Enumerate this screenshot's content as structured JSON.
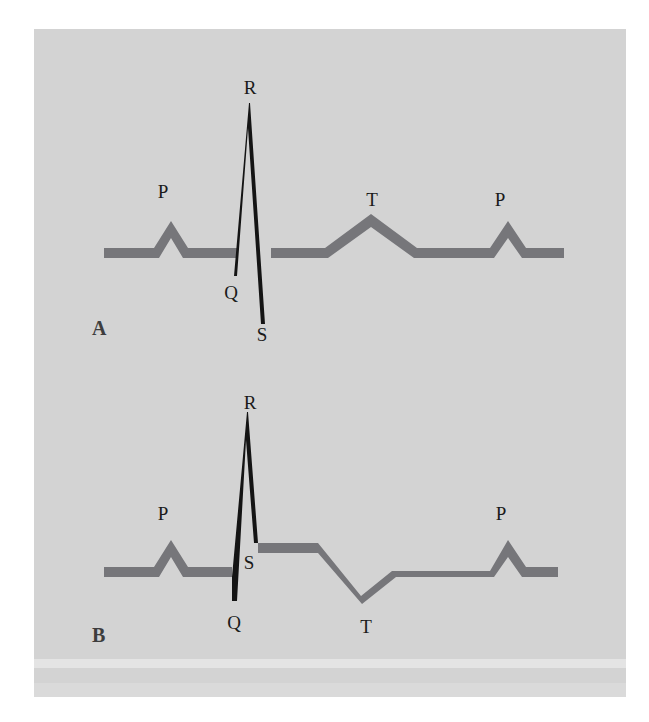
{
  "figure": {
    "background_color": "#ffffff",
    "plate_color": "#d3d3d3",
    "trace_color": "#76767a",
    "spike_color": "#141414",
    "label_color": "#1a1a1a",
    "panel_letter_color": "#3d3d3d"
  },
  "panels": [
    {
      "id": "panel-a",
      "letter": "A",
      "letter_x": 92,
      "letter_y": 318,
      "description": "Normal ECG tracing: upright P wave, narrow QRS complex, upright T wave, second P wave",
      "baseline_y": 253,
      "labels": [
        {
          "name": "p-wave-label-1",
          "text": "P",
          "x": 163,
          "y": 182
        },
        {
          "name": "r-wave-label",
          "text": "R",
          "x": 250,
          "y": 78
        },
        {
          "name": "q-wave-label",
          "text": "Q",
          "x": 231,
          "y": 283
        },
        {
          "name": "s-wave-label",
          "text": "S",
          "x": 262,
          "y": 325
        },
        {
          "name": "t-wave-label",
          "text": "T",
          "x": 372,
          "y": 190
        },
        {
          "name": "p-wave-label-2",
          "text": "P",
          "x": 500,
          "y": 190
        }
      ],
      "ribbon_path": "M 104,248 L 154,248 L 171,221 L 188,248 L 238,248 L 238,258 L 183,258 L 171,238 L 159,258 L 104,258 Z M 271,248 L 325,248 L 371,214 L 417,248 L 490,248 L 508,221 L 526,248 L 564,248 L 564,258 L 522,258 L 508,238 L 494,258 L 414,258 L 371,227 L 328,258 L 271,258 Z",
      "spike_path": "M 234,276 L 249,103 L 250,103 L 265,324 L 261,324 L 248,128 L 237,276 Z"
    },
    {
      "id": "panel-b",
      "letter": "B",
      "letter_x": 92,
      "letter_y": 625,
      "description": "Abnormal ECG tracing: upright P wave, deep Q wave, elevated ST segment at S, inverted T wave, second P wave",
      "baseline_y": 576,
      "labels": [
        {
          "name": "p-wave-label-1",
          "text": "P",
          "x": 163,
          "y": 504
        },
        {
          "name": "r-wave-label",
          "text": "R",
          "x": 250,
          "y": 393
        },
        {
          "name": "q-wave-label",
          "text": "Q",
          "x": 234,
          "y": 613
        },
        {
          "name": "s-wave-label",
          "text": "S",
          "x": 249,
          "y": 553
        },
        {
          "name": "t-wave-label",
          "text": "T",
          "x": 366,
          "y": 617
        },
        {
          "name": "p-wave-label-2",
          "text": "P",
          "x": 501,
          "y": 504
        }
      ],
      "ribbon_path": "M 104,567 L 154,567 L 171,540 L 188,567 L 232,567 L 232,577 L 183,577 L 171,557 L 159,577 L 104,577 Z M 258,543 L 318,543 L 361,596 L 392,571 L 490,571 L 508,540 L 526,567 L 558,567 L 558,577 L 522,577 L 508,557 L 494,577 L 396,577 L 362,604 L 318,553 L 258,553 Z",
      "spike_path": "M 232,577 L 247,412 L 248,412 L 258,543 L 254,543 L 246,440 L 237,601 L 232,601 Z"
    }
  ]
}
